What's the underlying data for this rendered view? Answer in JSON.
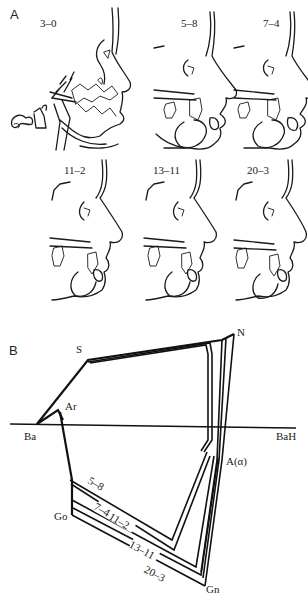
{
  "figure": {
    "panel_a": {
      "letter": "A",
      "tracings": [
        {
          "age": "3–0"
        },
        {
          "age": "5–8"
        },
        {
          "age": "7–4"
        },
        {
          "age": "11–2"
        },
        {
          "age": "13–11"
        },
        {
          "age": "20–3"
        }
      ]
    },
    "panel_b": {
      "letter": "B",
      "landmarks": {
        "S": "S",
        "N": "N",
        "Ar": "Ar",
        "Ba": "Ba",
        "BaH": "BaH",
        "A": "A(α)",
        "Go": "Go",
        "Gn": "Gn"
      },
      "series_labels": [
        "5–8",
        "7–4",
        "11–2",
        "13–11",
        "20–3"
      ]
    }
  }
}
